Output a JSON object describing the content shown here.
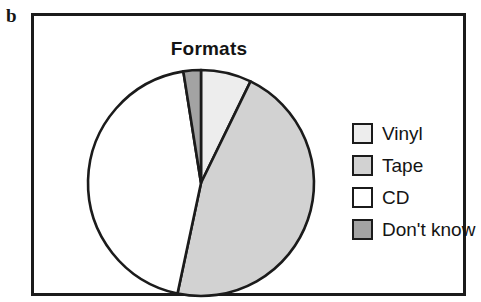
{
  "panel": {
    "label": "b"
  },
  "chart_data": {
    "type": "pie",
    "title": "Formats",
    "xlabel": "",
    "ylabel": "",
    "legend_position": "right",
    "grid": false,
    "categories": [
      "Vinyl",
      "Tape",
      "CD",
      "Don't know"
    ],
    "values": [
      7.2,
      46.1,
      44.2,
      2.5
    ],
    "unit": "percent",
    "start_angle_deg": 0,
    "direction": "clockwise",
    "slices": [
      {
        "label": "Vinyl",
        "value": 7.2,
        "color": "#ededed",
        "start_angle_deg": 0,
        "end_angle_deg": 26
      },
      {
        "label": "Tape",
        "value": 46.1,
        "color": "#d2d2d2",
        "start_angle_deg": 26,
        "end_angle_deg": 192
      },
      {
        "label": "CD",
        "value": 44.2,
        "color": "#ffffff",
        "start_angle_deg": 192,
        "end_angle_deg": 351
      },
      {
        "label": "Don't know",
        "value": 2.5,
        "color": "#a3a3a3",
        "start_angle_deg": 351,
        "end_angle_deg": 360
      }
    ],
    "geometry": {
      "center_x": 165,
      "center_y": 165,
      "radius": 111
    },
    "stroke_color": "#1b1b1b"
  },
  "legend": {
    "items": [
      {
        "label": "Vinyl",
        "color": "#ededed"
      },
      {
        "label": "Tape",
        "color": "#d2d2d2"
      },
      {
        "label": "CD",
        "color": "#ffffff"
      },
      {
        "label": "Don't know",
        "color": "#a3a3a3"
      }
    ]
  }
}
